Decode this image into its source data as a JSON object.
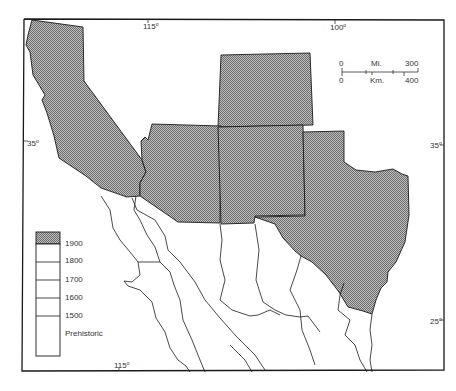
{
  "map": {
    "fill_pattern_color": "#8a8a8a",
    "border_color": "#1a1a1a",
    "background": "#ffffff",
    "graticule": {
      "top_left_lon": "115",
      "top_right_lon": "100",
      "left_lat": "35",
      "right_lat_top": "35",
      "right_lat_bottom": "25",
      "bottom_lon": "115",
      "degree_symbol": "o"
    },
    "scale_bar": {
      "miles_start": "0",
      "miles_unit": "Mi.",
      "miles_end": "300",
      "km_start": "0",
      "km_unit": "Km.",
      "km_end": "400"
    },
    "shaded_regions": [
      "California",
      "Arizona",
      "New Mexico",
      "Colorado",
      "Texas"
    ],
    "legend": {
      "entries": [
        {
          "label": "1900",
          "shaded": true
        },
        {
          "label": "1800",
          "shaded": false
        },
        {
          "label": "1700",
          "shaded": false
        },
        {
          "label": "1600",
          "shaded": false
        },
        {
          "label": "1500",
          "shaded": false
        },
        {
          "label": "Prehistoric",
          "shaded": false
        }
      ]
    }
  }
}
